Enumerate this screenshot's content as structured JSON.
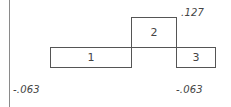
{
  "diagram": {
    "boxes": [
      {
        "id": "1",
        "label": "1"
      },
      {
        "id": "2",
        "label": "2"
      },
      {
        "id": "3",
        "label": "3"
      }
    ],
    "values": {
      "top_right": ".127",
      "bottom_left": "-.063",
      "bottom_right": "-.063"
    },
    "colors": {
      "line": "#555555",
      "text": "#444444",
      "axis": "#8a8a8a"
    }
  }
}
